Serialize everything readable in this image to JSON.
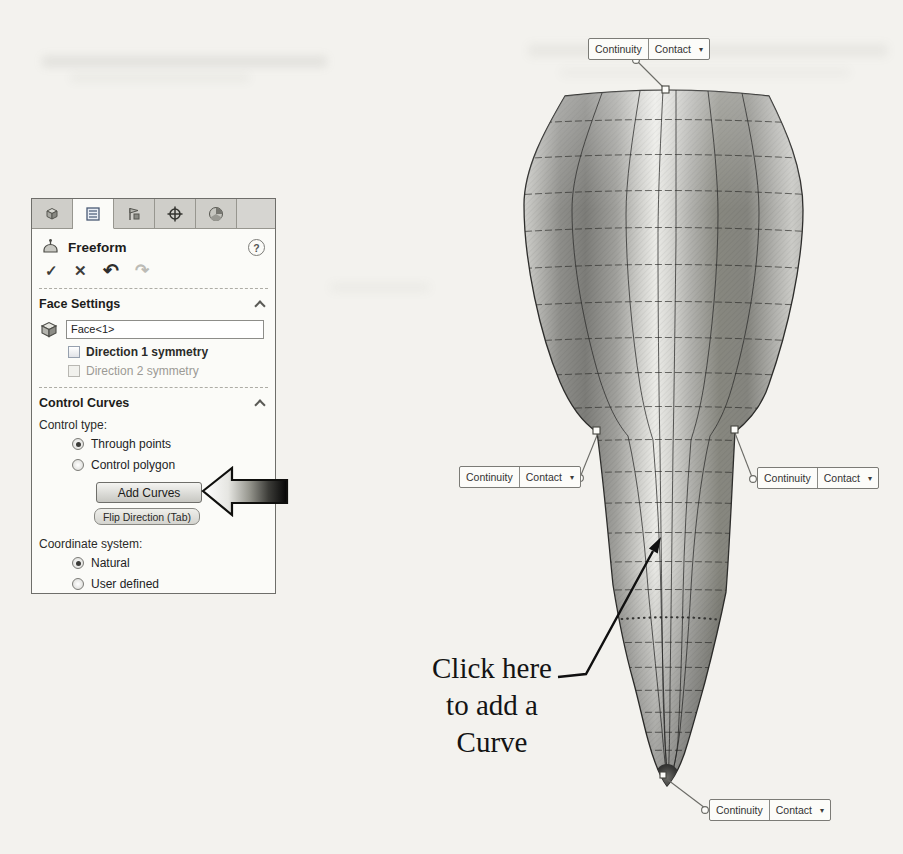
{
  "icons": {
    "ok": "✓",
    "cancel": "✕",
    "undo": "↶",
    "redo": "↷",
    "help": "?",
    "dropdown_caret": "▾"
  },
  "panel": {
    "title": "Freeform",
    "face_settings": {
      "header": "Face Settings",
      "face_value": "Face<1>",
      "direction1_label": "Direction 1 symmetry",
      "direction1_checked": false,
      "direction2_label": "Direction 2 symmetry",
      "direction2_checked": false,
      "direction2_enabled": false
    },
    "control_curves": {
      "header": "Control Curves",
      "control_type_label": "Control type:",
      "through_points_label": "Through points",
      "through_points_selected": true,
      "control_polygon_label": "Control polygon",
      "control_polygon_selected": false,
      "add_curves_label": "Add Curves",
      "flip_direction_label": "Flip Direction (Tab)",
      "coordinate_system_label": "Coordinate system:",
      "natural_label": "Natural",
      "natural_selected": true,
      "user_defined_label": "User defined",
      "user_defined_selected": false
    }
  },
  "callouts": {
    "continuity_label": "Continuity",
    "contact_value": "Contact"
  },
  "annotation": {
    "line1": "Click here",
    "line2": "to add a",
    "line3": "Curve"
  }
}
